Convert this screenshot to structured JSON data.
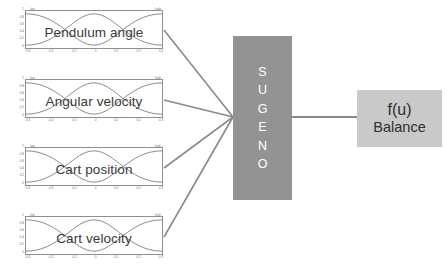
{
  "diagram": {
    "background_color": "#ffffff",
    "wire_color": "#8a8a8a"
  },
  "inputs": [
    {
      "label": "Pendulum angle",
      "mf_left_name": "low",
      "mf_right_name": "high",
      "y_ticks": [
        "1",
        "0.8",
        "0.6",
        "0.4",
        "0.2",
        "0"
      ],
      "x_ticks": [
        "-0.3",
        "-0.2",
        "-0.1",
        "0",
        "0.1",
        "0.2",
        "0.3"
      ],
      "plot_type": "membership-functions"
    },
    {
      "label": "Angular velocity",
      "mf_left_name": "low",
      "mf_right_name": "high",
      "y_ticks": [
        "1",
        "0.8",
        "0.6",
        "0.4",
        "0.2",
        "0"
      ],
      "x_ticks": [
        "-0.3",
        "-0.2",
        "-0.1",
        "0",
        "0.1",
        "0.2",
        "0.3"
      ],
      "plot_type": "membership-functions"
    },
    {
      "label": "Cart position",
      "mf_left_name": "low",
      "mf_right_name": "high",
      "y_ticks": [
        "1",
        "0.8",
        "0.6",
        "0.4",
        "0.2",
        "0"
      ],
      "x_ticks": [
        "-0.3",
        "-0.2",
        "-0.1",
        "0",
        "0.1",
        "0.2",
        "0.3"
      ],
      "plot_type": "membership-functions"
    },
    {
      "label": "Cart velocity",
      "mf_left_name": "low",
      "mf_right_name": "high",
      "y_ticks": [
        "1",
        "0.8",
        "0.6",
        "0.4",
        "0.2",
        "0"
      ],
      "x_ticks": [
        "-0.3",
        "-0.2",
        "-0.1",
        "0",
        "0.1",
        "0.2",
        "0.3"
      ],
      "plot_type": "membership-functions"
    }
  ],
  "inference_block": {
    "name": "SUGENO",
    "letters": [
      "S",
      "U",
      "G",
      "E",
      "N",
      "O"
    ],
    "color": "#939393",
    "text_color": "#ffffff"
  },
  "output_block": {
    "function_label": "f(u)",
    "name": "Balance",
    "color": "#c9c9c9",
    "text_color": "#2e2e2e"
  }
}
